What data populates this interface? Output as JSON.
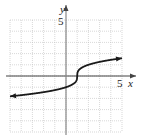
{
  "chart_data": {
    "type": "line",
    "title": "",
    "xlabel": "x",
    "ylabel": "y",
    "xlim": [
      -5,
      5
    ],
    "ylim": [
      -5,
      5
    ],
    "grid": true,
    "tick_labels": {
      "x": [
        "5"
      ],
      "y": [
        "5"
      ]
    },
    "function": "y = cbrt(x - 1)",
    "series": [
      {
        "name": "f(x)",
        "x": [
          -5,
          -4,
          -3,
          -2,
          -1,
          0,
          0.5,
          0.9,
          1,
          1.1,
          1.5,
          2,
          3,
          4,
          5
        ],
        "y": [
          -1.82,
          -1.71,
          -1.59,
          -1.44,
          -1.26,
          -1,
          -0.79,
          -0.46,
          0,
          0.46,
          0.79,
          1,
          1.26,
          1.44,
          1.59
        ]
      }
    ],
    "arrows_at_ends": true
  },
  "labels": {
    "x_axis": "x",
    "y_axis": "y",
    "x_tick": "5",
    "y_tick": "5"
  },
  "colors": {
    "grid": "#bdbdbd",
    "axis": "#555555",
    "curve": "#1a1a1a"
  }
}
